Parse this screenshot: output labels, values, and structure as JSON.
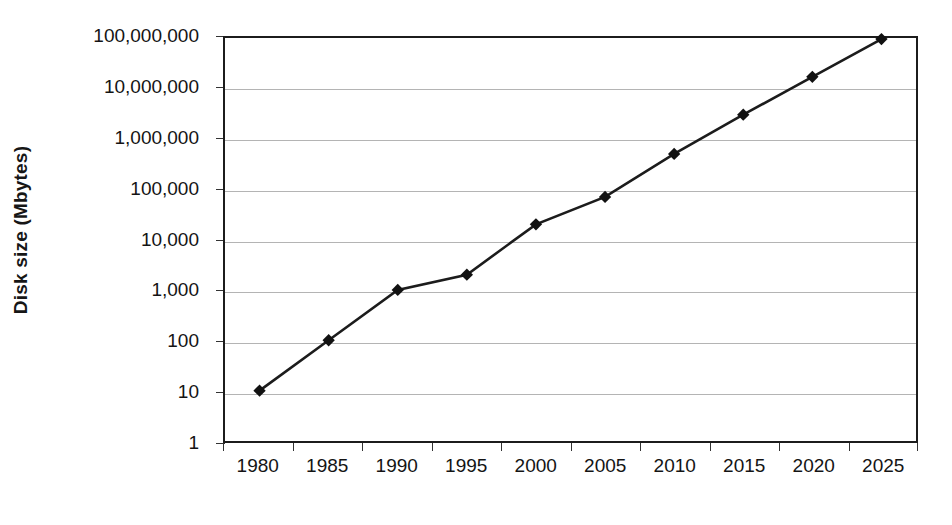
{
  "chart_data": {
    "type": "line",
    "title": "",
    "subtitle": "",
    "xlabel": "",
    "ylabel": "Disk size (Mbytes)",
    "categories": [
      "1980",
      "1985",
      "1990",
      "1995",
      "2000",
      "2005",
      "2010",
      "2015",
      "2020",
      "2025"
    ],
    "values": [
      10,
      100,
      1000,
      2000,
      20000,
      70000,
      500000,
      3000000,
      17000000,
      95000000
    ],
    "series": [
      {
        "name": "Disk size",
        "values": [
          10,
          100,
          1000,
          2000,
          20000,
          70000,
          500000,
          3000000,
          17000000,
          95000000
        ]
      }
    ],
    "yscale": "log",
    "ylim": [
      1,
      100000000
    ],
    "ytick_values": [
      1,
      10,
      100,
      1000,
      10000,
      100000,
      1000000,
      10000000,
      100000000
    ],
    "ytick_labels": [
      "100,000,000",
      "10,000,000",
      "1,000,000",
      "100,000",
      "10,000",
      "1,000",
      "100",
      "10",
      "1"
    ],
    "grid": "horizontal",
    "legend": "none",
    "legend_position": "",
    "marker": "diamond",
    "colors": {
      "line": "#1c1c1c",
      "marker": "#111111",
      "grid": "#b4b4b4",
      "axis": "#1c1c1c",
      "background": "#ffffff",
      "text": "#141414"
    },
    "annotations": []
  }
}
